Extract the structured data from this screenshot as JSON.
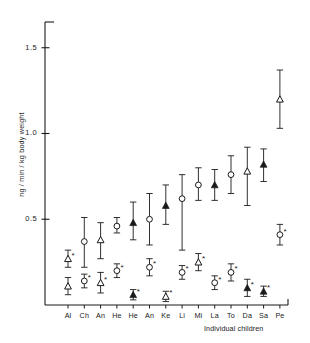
{
  "chart_data": {
    "type": "scatter",
    "title": "",
    "xlabel": "Individual children",
    "ylabel": "ng / min / kg body weight",
    "ylim": [
      0.0,
      1.65
    ],
    "yticks": [
      0.5,
      1.0,
      1.5
    ],
    "ytick_labels": [
      "0.5",
      "1.0",
      "1.5"
    ],
    "grid": false,
    "legend_position": "none",
    "categories": [
      "Al",
      "Ch",
      "An",
      "He",
      "He",
      "An",
      "Ke",
      "Li",
      "Mi",
      "La",
      "To",
      "Da",
      "Sa",
      "Pe"
    ],
    "series": [
      {
        "name": "upper-series",
        "marker_shapes": [
          "open-triangle",
          "open-circle",
          "open-triangle",
          "open-circle",
          "filled-triangle",
          "open-circle",
          "filled-triangle",
          "open-circle",
          "open-circle",
          "filled-triangle",
          "open-circle",
          "open-triangle",
          "filled-triangle",
          "open-triangle"
        ],
        "values": [
          0.27,
          0.37,
          0.38,
          0.46,
          0.48,
          0.5,
          0.58,
          0.62,
          0.7,
          0.7,
          0.76,
          0.78,
          0.82,
          1.2
        ],
        "err_low": [
          0.05,
          0.15,
          0.11,
          0.04,
          0.1,
          0.15,
          0.11,
          0.3,
          0.09,
          0.09,
          0.11,
          0.2,
          0.1,
          0.17
        ],
        "err_high": [
          0.05,
          0.14,
          0.1,
          0.05,
          0.12,
          0.15,
          0.12,
          0.14,
          0.1,
          0.09,
          0.11,
          0.14,
          0.09,
          0.17
        ],
        "significance": [
          "*",
          "",
          "",
          "",
          "",
          "",
          "",
          "",
          "",
          "",
          "",
          "",
          "",
          ""
        ]
      },
      {
        "name": "lower-series",
        "marker_shapes": [
          "open-triangle",
          "open-circle",
          "open-triangle",
          "open-circle",
          "filled-triangle",
          "open-circle",
          "open-triangle",
          "open-circle",
          "open-triangle",
          "open-circle",
          "open-circle",
          "filled-triangle",
          "filled-triangle",
          "open-circle"
        ],
        "values": [
          0.11,
          0.14,
          0.13,
          0.2,
          0.06,
          0.22,
          0.05,
          0.19,
          0.25,
          0.13,
          0.19,
          0.1,
          0.08,
          0.41
        ],
        "err_low": [
          0.05,
          0.04,
          0.06,
          0.04,
          0.03,
          0.05,
          0.03,
          0.04,
          0.05,
          0.04,
          0.05,
          0.05,
          0.03,
          0.06
        ],
        "err_high": [
          0.05,
          0.04,
          0.06,
          0.04,
          0.03,
          0.05,
          0.03,
          0.04,
          0.05,
          0.04,
          0.05,
          0.05,
          0.03,
          0.06
        ],
        "significance": [
          "",
          "*",
          "*",
          "*",
          "*",
          "*",
          "*",
          "*",
          "*",
          "*",
          "*",
          "*",
          "*",
          "*"
        ]
      }
    ]
  },
  "colors": {
    "axis": "#1a1a1a",
    "marker": "#1a1a1a",
    "background": "#ffffff"
  }
}
